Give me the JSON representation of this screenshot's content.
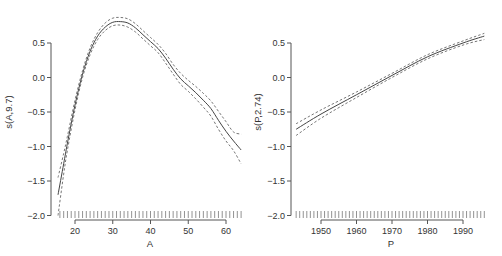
{
  "chart_data": [
    {
      "type": "line",
      "title": "",
      "xlabel": "A",
      "ylabel": "s(A,9.7)",
      "xlim": [
        15,
        65
      ],
      "ylim": [
        -2.0,
        0.85
      ],
      "xticks": [
        "20",
        "30",
        "40",
        "50",
        "60"
      ],
      "yticks": [
        "0.5",
        "0.0",
        "-0.5",
        "-1.0",
        "-1.5",
        "-2.0"
      ],
      "grid": false,
      "legend": null,
      "rug": "every integer from 16 to 64",
      "x": [
        15.5,
        17,
        18,
        20,
        22,
        24,
        26,
        28,
        30,
        32,
        34,
        36,
        38,
        40,
        42,
        44,
        46,
        48,
        50,
        52,
        54,
        56,
        58,
        60,
        62,
        64
      ],
      "series": [
        {
          "name": "fit",
          "style": "solid",
          "values": [
            -1.7,
            -1.25,
            -0.95,
            -0.4,
            0.05,
            0.38,
            0.6,
            0.73,
            0.8,
            0.81,
            0.79,
            0.72,
            0.62,
            0.52,
            0.42,
            0.28,
            0.12,
            -0.02,
            -0.12,
            -0.22,
            -0.33,
            -0.45,
            -0.62,
            -0.78,
            -0.92,
            -1.05
          ]
        },
        {
          "name": "upper",
          "style": "dashed",
          "values": [
            -1.45,
            -1.1,
            -0.85,
            -0.33,
            0.1,
            0.43,
            0.65,
            0.79,
            0.86,
            0.87,
            0.85,
            0.78,
            0.68,
            0.58,
            0.48,
            0.35,
            0.19,
            0.06,
            -0.04,
            -0.13,
            -0.23,
            -0.34,
            -0.49,
            -0.64,
            -0.79,
            -0.82
          ]
        },
        {
          "name": "lower",
          "style": "dashed",
          "values": [
            -2.0,
            -1.4,
            -1.05,
            -0.47,
            0.0,
            0.33,
            0.55,
            0.68,
            0.75,
            0.76,
            0.73,
            0.66,
            0.56,
            0.46,
            0.36,
            0.21,
            0.05,
            -0.1,
            -0.2,
            -0.31,
            -0.43,
            -0.56,
            -0.75,
            -0.92,
            -1.06,
            -1.25
          ]
        }
      ]
    },
    {
      "type": "line",
      "title": "",
      "xlabel": "P",
      "ylabel": "s(P,2.74)",
      "xlim": [
        1942,
        1997
      ],
      "ylim": [
        -2.0,
        0.85
      ],
      "xticks": [
        "1950",
        "1960",
        "1970",
        "1980",
        "1990"
      ],
      "yticks": [
        "0.5",
        "0.0",
        "-0.5",
        "-1.0",
        "-1.5",
        "-2.0"
      ],
      "grid": false,
      "legend": null,
      "rug": "every year from 1943 to 1996",
      "x": [
        1943,
        1950,
        1960,
        1970,
        1980,
        1990,
        1996
      ],
      "series": [
        {
          "name": "fit",
          "style": "solid",
          "values": [
            -0.75,
            -0.53,
            -0.25,
            0.03,
            0.3,
            0.5,
            0.6
          ]
        },
        {
          "name": "upper",
          "style": "dashed",
          "values": [
            -0.67,
            -0.47,
            -0.21,
            0.06,
            0.33,
            0.53,
            0.64
          ]
        },
        {
          "name": "lower",
          "style": "dashed",
          "values": [
            -0.84,
            -0.59,
            -0.29,
            0.0,
            0.27,
            0.47,
            0.55
          ]
        }
      ]
    }
  ],
  "panels": {
    "left": {
      "xlabel": "A",
      "ylabel": "s(A,9.7)"
    },
    "right": {
      "xlabel": "P",
      "ylabel": "s(P,2.74)"
    }
  }
}
